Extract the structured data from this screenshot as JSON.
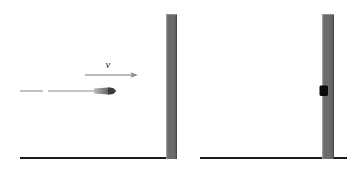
{
  "figure": {
    "type": "physics-diagram",
    "background_color": "#ffffff",
    "width": 354,
    "height": 172
  },
  "colors": {
    "wall_fill": "#6e6e6e",
    "wall_edge_light": "#9a9a9a",
    "wall_edge_dark": "#4a4a4a",
    "ground_line": "#1a1a1a",
    "bullet_fill": "#4a4a4a",
    "bullet_dark": "#111111",
    "trajectory_line": "#8a8a8a",
    "velocity_arrow": "#9e9e9e",
    "label_text": "#2b2b2b",
    "embedded_bullet": "#0a0a0a"
  },
  "panels": [
    {
      "id": "before",
      "name": "before-impact-panel",
      "ground": {
        "x1": 20,
        "x2": 172,
        "y": 158,
        "thickness": 2
      },
      "wall": {
        "x": 166,
        "y": 14,
        "width": 11,
        "height": 145
      },
      "trajectory": {
        "label": "dashed-trajectory",
        "y": 91,
        "dashes": [
          {
            "x1": 20,
            "x2": 43
          },
          {
            "x1": 48,
            "x2": 95
          }
        ]
      },
      "projectile": {
        "name": "bullet",
        "tip_x": 116,
        "tail_x": 94,
        "center_y": 91,
        "half_height": 3.5
      },
      "velocity_vector": {
        "symbol": "v",
        "label_x": 108,
        "label_y": 68,
        "arrow_x1": 85,
        "arrow_x2": 138,
        "arrow_y": 75,
        "head_length": 7,
        "head_half_width": 3.2
      }
    },
    {
      "id": "after",
      "name": "after-impact-panel",
      "ground": {
        "x1": 200,
        "x2": 347,
        "y": 158,
        "thickness": 2
      },
      "wall": {
        "x": 322,
        "y": 14,
        "width": 12,
        "height": 145
      },
      "embedded_projectile": {
        "name": "embedded-bullet",
        "x": 319,
        "y": 85,
        "width": 9,
        "height": 11
      }
    }
  ]
}
